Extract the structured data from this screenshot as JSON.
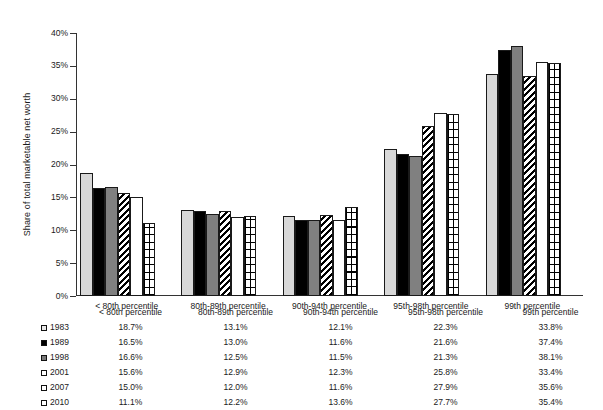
{
  "chart_data": {
    "type": "bar",
    "title": "",
    "xlabel": "",
    "ylabel": "Share of total marketable net worth",
    "ylim": [
      0,
      40
    ],
    "ytick_step": 5,
    "ytick_labels": [
      "0%",
      "5%",
      "10%",
      "15%",
      "20%",
      "25%",
      "30%",
      "35%",
      "40%"
    ],
    "ytick_values": [
      0,
      5,
      10,
      15,
      20,
      25,
      30,
      35,
      40
    ],
    "grid": false,
    "legend_position": "bottom-table",
    "categories": [
      "< 80th percentile",
      "80th-89th percentile",
      "90th-94th percentile",
      "95th-98th percentile",
      "99th percentile"
    ],
    "series": [
      {
        "name": "1983",
        "pattern": "light-gray-solid",
        "values": [
          18.7,
          13.1,
          12.1,
          22.3,
          33.8
        ],
        "labels": [
          "18.7%",
          "13.1%",
          "12.1%",
          "22.3%",
          "33.8%"
        ]
      },
      {
        "name": "1989",
        "pattern": "black-solid",
        "values": [
          16.5,
          13.0,
          11.6,
          21.6,
          37.4
        ],
        "labels": [
          "16.5%",
          "13.0%",
          "11.6%",
          "21.6%",
          "37.4%"
        ]
      },
      {
        "name": "1998",
        "pattern": "dark-gray-solid",
        "values": [
          16.6,
          12.5,
          11.5,
          21.3,
          38.1
        ],
        "labels": [
          "16.6%",
          "12.5%",
          "11.5%",
          "21.3%",
          "38.1%"
        ]
      },
      {
        "name": "2001",
        "pattern": "diagonal-hatch",
        "values": [
          15.6,
          12.9,
          12.3,
          25.8,
          33.4
        ],
        "labels": [
          "15.6%",
          "12.9%",
          "12.3%",
          "25.8%",
          "33.4%"
        ]
      },
      {
        "name": "2007",
        "pattern": "white-solid",
        "values": [
          15.0,
          12.0,
          11.6,
          27.9,
          35.6
        ],
        "labels": [
          "15.0%",
          "12.0%",
          "11.6%",
          "27.9%",
          "35.6%"
        ]
      },
      {
        "name": "2010",
        "pattern": "grid-hatch",
        "values": [
          11.1,
          12.2,
          13.6,
          27.7,
          35.4
        ],
        "labels": [
          "11.1%",
          "12.2%",
          "13.6%",
          "27.7%",
          "35.4%"
        ]
      }
    ],
    "colors": {
      "light_gray": "#d8d8d8",
      "black": "#000000",
      "dark_gray": "#808080",
      "white": "#ffffff",
      "outline": "#1a1a1a",
      "axis": "#333333"
    }
  },
  "table": {
    "blank_header": "",
    "headers": [
      "< 80th percentile",
      "80th-89th percentile",
      "90th-94th percentile",
      "95th-98th percentile",
      "99th percentile"
    ],
    "rows": [
      {
        "year": "1983",
        "values": [
          "18.7%",
          "13.1%",
          "12.1%",
          "22.3%",
          "33.8%"
        ]
      },
      {
        "year": "1989",
        "values": [
          "16.5%",
          "13.0%",
          "11.6%",
          "21.6%",
          "37.4%"
        ]
      },
      {
        "year": "1998",
        "values": [
          "16.6%",
          "12.5%",
          "11.5%",
          "21.3%",
          "38.1%"
        ]
      },
      {
        "year": "2001",
        "values": [
          "15.6%",
          "12.9%",
          "12.3%",
          "25.8%",
          "33.4%"
        ]
      },
      {
        "year": "2007",
        "values": [
          "15.0%",
          "12.0%",
          "11.6%",
          "27.9%",
          "35.6%"
        ]
      },
      {
        "year": "2010",
        "values": [
          "11.1%",
          "12.2%",
          "13.6%",
          "27.7%",
          "35.4%"
        ]
      }
    ]
  }
}
